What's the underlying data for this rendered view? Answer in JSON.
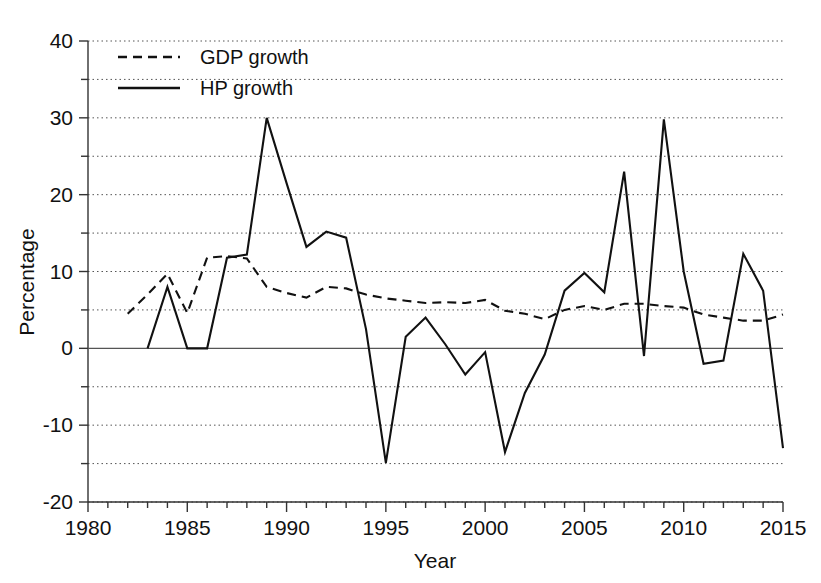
{
  "chart_data": {
    "type": "line",
    "title": "",
    "xlabel": "Year",
    "ylabel": "Percentage",
    "xlim": [
      1980,
      2015
    ],
    "ylim": [
      -20,
      40
    ],
    "x_major_ticks": [
      1980,
      1985,
      1990,
      1995,
      2000,
      2005,
      2010,
      2015
    ],
    "x_minor_tick_step": 1,
    "y_major_ticks": [
      -20,
      -10,
      0,
      10,
      20,
      30,
      40
    ],
    "y_minor_ticks": [
      -15,
      -5,
      5,
      15,
      25,
      35
    ],
    "y_tick_labels": [
      "-20",
      "-10",
      "0",
      "10",
      "20",
      "30",
      "40"
    ],
    "x_tick_labels": [
      "1980",
      "1985",
      "1990",
      "1995",
      "2000",
      "2005",
      "2010",
      "2015"
    ],
    "grid": "horizontal-dotted",
    "legend_position": "top-left-inside",
    "zero_line": true,
    "series": [
      {
        "name": "GDP growth",
        "style": "dashed",
        "color": "#111111",
        "x": [
          1982,
          1983,
          1984,
          1985,
          1986,
          1987,
          1988,
          1989,
          1990,
          1991,
          1992,
          1993,
          1994,
          1995,
          1996,
          1997,
          1998,
          1999,
          2000,
          2001,
          2002,
          2003,
          2004,
          2005,
          2006,
          2007,
          2008,
          2009,
          2010,
          2011,
          2012,
          2013,
          2014,
          2015
        ],
        "values": [
          4.5,
          7.0,
          9.7,
          4.6,
          11.8,
          12.0,
          11.7,
          8.0,
          7.2,
          6.6,
          8.0,
          7.8,
          7.0,
          6.5,
          6.2,
          5.9,
          6.0,
          5.9,
          6.3,
          4.9,
          4.5,
          3.8,
          5.0,
          5.5,
          5.0,
          5.8,
          5.8,
          5.5,
          5.3,
          4.4,
          4.0,
          3.6,
          3.6,
          4.4
        ]
      },
      {
        "name": "HP growth",
        "style": "solid",
        "color": "#111111",
        "x": [
          1983,
          1984,
          1985,
          1986,
          1987,
          1988,
          1989,
          1990,
          1991,
          1992,
          1993,
          1994,
          1995,
          1996,
          1997,
          1998,
          1999,
          2000,
          2001,
          2002,
          2003,
          2004,
          2005,
          2006,
          2007,
          2008,
          2009,
          2010,
          2011,
          2012,
          2013,
          2014,
          2015
        ],
        "values": [
          0.0,
          8.0,
          0.0,
          0.0,
          11.8,
          12.2,
          30.0,
          21.5,
          13.2,
          15.2,
          14.4,
          2.5,
          -14.9,
          1.5,
          4.0,
          0.5,
          -3.4,
          -0.5,
          -13.5,
          -5.8,
          -0.8,
          7.5,
          9.8,
          7.3,
          23.0,
          -1.0,
          29.8,
          10.0,
          -2.0,
          -1.6,
          12.3,
          7.5,
          -13.0
        ]
      }
    ],
    "legend": [
      {
        "label": "GDP growth",
        "style": "dashed"
      },
      {
        "label": "HP growth",
        "style": "solid"
      }
    ]
  }
}
